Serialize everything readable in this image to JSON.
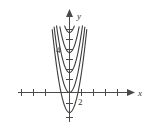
{
  "figure": {
    "background_color": "#ffffff",
    "curve_color": "#3b3b3b",
    "axis_color": "#4a4a4a"
  },
  "axes": {
    "x_axis_label": "x",
    "y_axis_label": "y",
    "x_tick_label": "2",
    "y_tick_label": "4",
    "x_arrow_icon": "arrow-right-icon",
    "y_arrow_icon": "arrow-up-icon"
  },
  "chart_data": {
    "type": "line",
    "title": "",
    "xlabel": "x",
    "ylabel": "y",
    "xlim": [
      -3.6,
      4.8
    ],
    "ylim": [
      -2.6,
      7.4
    ],
    "grid": false,
    "legend": "none",
    "xticks": [
      -3,
      -2,
      -1,
      1,
      2,
      3,
      4
    ],
    "xtick_labels": [
      "",
      "",
      "",
      "",
      "2",
      "",
      ""
    ],
    "yticks": [
      -2,
      -1,
      1,
      2,
      3,
      4,
      5,
      6
    ],
    "ytick_labels": [
      "",
      "",
      "",
      "",
      "",
      "",
      "4",
      "",
      ""
    ],
    "series": [
      {
        "name": "y = 4x^2 + 6",
        "formula_a": 4,
        "vertex": [
          0,
          6
        ],
        "values": [
          6
        ]
      },
      {
        "name": "y = 4x^2 + 4",
        "formula_a": 4,
        "vertex": [
          0,
          4
        ],
        "values": [
          4
        ]
      },
      {
        "name": "y = 4x^2 + 2",
        "formula_a": 4,
        "vertex": [
          0,
          2
        ],
        "values": [
          2
        ]
      },
      {
        "name": "y = 4x^2",
        "formula_a": 4,
        "vertex": [
          0,
          0
        ],
        "values": [
          0
        ]
      },
      {
        "name": "y = 4x^2 - 2",
        "formula_a": 4,
        "vertex": [
          0,
          -2
        ],
        "values": [
          -2
        ]
      }
    ]
  }
}
